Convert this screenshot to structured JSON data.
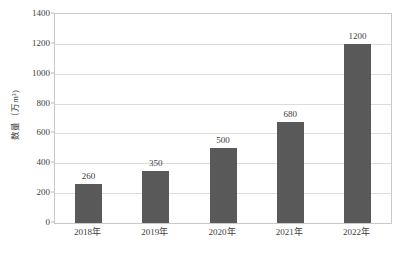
{
  "chart_data": {
    "type": "bar",
    "title": "",
    "subtitle": "",
    "xlabel": "",
    "ylabel": "数量（万m³)",
    "categories": [
      "2018年",
      "2019年",
      "2020年",
      "2021年",
      "2022年"
    ],
    "values": [
      260,
      350,
      500,
      680,
      1200
    ],
    "value_labels": [
      "260",
      "350",
      "500",
      "680",
      "1200"
    ],
    "series": [
      {
        "name": "数量",
        "values": [
          260,
          350,
          500,
          680,
          1200
        ]
      }
    ],
    "ylim": [
      0,
      1400
    ],
    "y_ticks": [
      0,
      200,
      400,
      600,
      800,
      1000,
      1200,
      1400
    ],
    "y_tick_labels": [
      "0",
      "200",
      "400",
      "600",
      "800",
      "1000",
      "1200",
      "1400"
    ],
    "grid": true,
    "grid_axis": "y",
    "legend": false,
    "legend_position": "none",
    "bar_color": "#595959",
    "grid_color": "#dcdcdc",
    "axis_color": "#c9c9c9",
    "text_color": "#3d3d3d",
    "background_color": "#ffffff",
    "data_labels_shown": true
  }
}
